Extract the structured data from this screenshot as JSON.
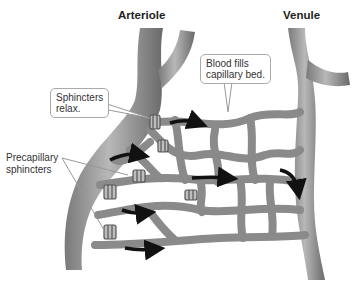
{
  "diagram": {
    "titles": {
      "arteriole": "Arteriole",
      "venule": "Venule"
    },
    "callouts": {
      "sphincters_relax_line1": "Sphincters",
      "sphincters_relax_line2": "relax.",
      "blood_fills_line1": "Blood fills",
      "blood_fills_line2": "capillary bed."
    },
    "labels": {
      "precapillary_line1": "Precapillary",
      "precapillary_line2": "sphincters"
    },
    "colors": {
      "vessel_fill": "#9a9a9a",
      "vessel_dark": "#6e6e6e",
      "vessel_light": "#c8c8c8",
      "arrow": "#111111",
      "background": "#ffffff"
    }
  }
}
